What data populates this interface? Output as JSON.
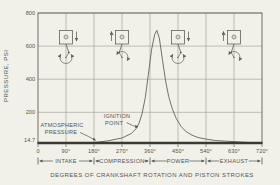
{
  "figure": {
    "caption": "DEGREES OF CRANKSHAFT ROTATION AND  PISTON STROKES",
    "ylabel": "PRESSURE, PSI"
  },
  "annotations": {
    "atmospheric": {
      "line1": "ATMOSPHERIC",
      "line2": "PRESSURE"
    },
    "ignition": {
      "line1": "IGNITION",
      "line2": "POINT"
    }
  },
  "axes": {
    "x_ticks": [
      {
        "deg": 0,
        "label": "0"
      },
      {
        "deg": 90,
        "label": "90°"
      },
      {
        "deg": 180,
        "label": "180°"
      },
      {
        "deg": 270,
        "label": "270°"
      },
      {
        "deg": 360,
        "label": "360°"
      },
      {
        "deg": 450,
        "label": "450°"
      },
      {
        "deg": 540,
        "label": "540°"
      },
      {
        "deg": 630,
        "label": "630°"
      },
      {
        "deg": 720,
        "label": "720°"
      }
    ],
    "y_ticks": [
      {
        "psi": 14.7,
        "label": "14.7"
      },
      {
        "psi": 200,
        "label": "200"
      },
      {
        "psi": 400,
        "label": "400"
      },
      {
        "psi": 600,
        "label": "600"
      },
      {
        "psi": 800,
        "label": "800"
      }
    ]
  },
  "strokes_band": [
    {
      "label": "INTAKE",
      "from_deg": 0,
      "to_deg": 180
    },
    {
      "label": "COMPRESSION",
      "from_deg": 180,
      "to_deg": 360
    },
    {
      "label": "POWER",
      "from_deg": 360,
      "to_deg": 540
    },
    {
      "label": "EXHAUST",
      "from_deg": 540,
      "to_deg": 720
    }
  ],
  "pistons": [
    {
      "name": "piston-diagram-intake",
      "stroke": "INTAKE",
      "center_deg": 90,
      "arrow": "down",
      "arrow_side": "right"
    },
    {
      "name": "piston-diagram-compression",
      "stroke": "COMPRESSION",
      "center_deg": 270,
      "arrow": "up",
      "arrow_side": "left"
    },
    {
      "name": "piston-diagram-power",
      "stroke": "POWER",
      "center_deg": 450,
      "arrow": "down",
      "arrow_side": "right"
    },
    {
      "name": "piston-diagram-exhaust",
      "stroke": "EXHAUST",
      "center_deg": 630,
      "arrow": "up",
      "arrow_side": "left"
    }
  ],
  "chart_data": {
    "type": "line",
    "title": "",
    "xlabel": "DEGREES OF CRANKSHAFT ROTATION AND  PISTON STROKES",
    "ylabel": "PRESSURE, PSI",
    "xlim": [
      0,
      720
    ],
    "ylim": [
      14.7,
      800
    ],
    "grid": true,
    "x": [
      0,
      90,
      180,
      225,
      270,
      300,
      315,
      325,
      335,
      345,
      355,
      365,
      375,
      382,
      390,
      400,
      410,
      420,
      432,
      445,
      460,
      475,
      495,
      515,
      540,
      570,
      600,
      630,
      675,
      720
    ],
    "y": [
      14.7,
      15,
      17,
      28,
      45,
      72,
      100,
      135,
      195,
      290,
      430,
      580,
      670,
      695,
      650,
      520,
      390,
      295,
      220,
      160,
      115,
      85,
      62,
      48,
      38,
      30,
      26,
      23,
      18,
      15
    ],
    "peak": {
      "deg": 382,
      "psi": 695
    },
    "annotations": [
      {
        "label": "ATMOSPHERIC PRESSURE",
        "psi": 14.7
      },
      {
        "label": "IGNITION POINT",
        "deg": 320,
        "psi": 120
      }
    ]
  },
  "colors": {
    "background": "#f1f0e9",
    "line": "#63635a",
    "grid": "#9c9c92",
    "baseline": "#3a3a31",
    "text": "#55554c"
  }
}
